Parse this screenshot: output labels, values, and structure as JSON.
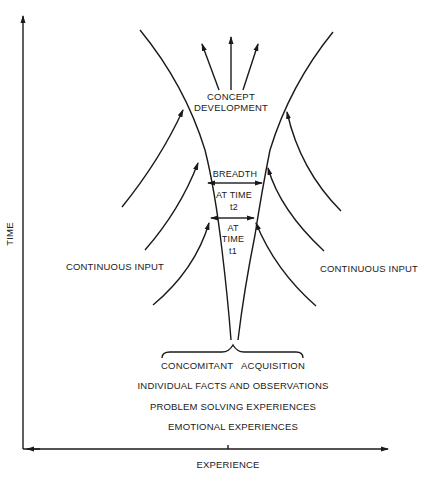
{
  "diagram": {
    "axes": {
      "y_label": "TIME",
      "x_label": "EXPERIENCE"
    },
    "top": {
      "label_line1": "CONCEPT",
      "label_line2": "DEVELOPMENT"
    },
    "breadth": {
      "label": "BREADTH",
      "t2_line1": "AT TIME",
      "t2_line2": "t2",
      "t1_line1": "AT",
      "t1_line2": "TIME",
      "t1_line3": "t1"
    },
    "inputs": {
      "left": "CONTINUOUS INPUT",
      "right": "CONTINUOUS INPUT"
    },
    "bottom": {
      "brace_label": "CONCOMITANT   ACQUISITION",
      "items": [
        "INDIVIDUAL FACTS AND OBSERVATIONS",
        "PROBLEM SOLVING EXPERIENCES",
        "EMOTIONAL EXPERIENCES"
      ]
    },
    "colors": {
      "ink": "#1a1a1a",
      "background": "#ffffff"
    }
  }
}
